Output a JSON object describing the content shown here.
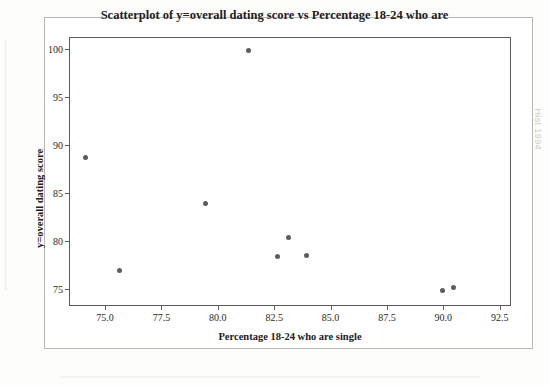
{
  "figure": {
    "background_color": "#fdfdfc",
    "frame_border_color": "#b9b6b1",
    "point_color": "#5f5d5a",
    "axis_color": "#5d5b58"
  },
  "artifacts": {
    "ghost_right": "Hist 1994",
    "ghost_center": ""
  },
  "chart_data": {
    "type": "scatter",
    "title": "Scatterplot of y=overall dating score vs Percentage 18-24 who are",
    "xlabel": "Percentage 18-24 who are single",
    "ylabel": "y=overall dating score",
    "xlim": [
      73.4,
      93.0
    ],
    "ylim": [
      73.2,
      101.3
    ],
    "xticks": [
      75.0,
      77.5,
      80.0,
      82.5,
      85.0,
      87.5,
      90.0,
      92.5
    ],
    "yticks": [
      75,
      80,
      85,
      90,
      95,
      100
    ],
    "xtick_labels": [
      "75.0",
      "77.5",
      "80.0",
      "82.5",
      "85.0",
      "87.5",
      "90.0",
      "92.5"
    ],
    "ytick_labels": [
      "75",
      "80",
      "85",
      "90",
      "95",
      "100"
    ],
    "grid": false,
    "legend": null,
    "points": [
      {
        "x": 74.1,
        "y": 88.8
      },
      {
        "x": 75.6,
        "y": 77.0
      },
      {
        "x": 79.4,
        "y": 84.0
      },
      {
        "x": 81.3,
        "y": 100.0
      },
      {
        "x": 82.6,
        "y": 78.5
      },
      {
        "x": 83.1,
        "y": 80.5
      },
      {
        "x": 83.9,
        "y": 78.6
      },
      {
        "x": 89.9,
        "y": 74.9
      },
      {
        "x": 90.4,
        "y": 75.2
      }
    ]
  }
}
